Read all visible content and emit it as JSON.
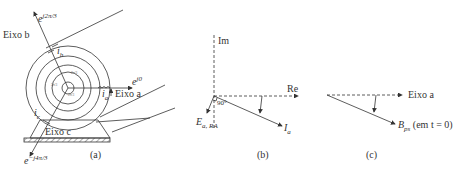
{
  "panels": [
    {
      "id": "a",
      "caption": "(a)",
      "labels": {
        "axis_a": "Eixo a",
        "axis_b": "Eixo b",
        "axis_c": "Eixo c",
        "phasor_a": "e^{j0}",
        "phasor_b": "e^{j2π/3}",
        "phasor_c": "e^{-j4π/3}",
        "current_a": "i_a",
        "current_b": "i_b",
        "current_c": "i_c",
        "inner_angle_label": "2π/3"
      }
    },
    {
      "id": "b",
      "caption": "(b)",
      "labels": {
        "imag_axis": "Im",
        "real_axis": "Re",
        "angle": "90°",
        "emf": "E_{a,RA}",
        "current": "I_a"
      }
    },
    {
      "id": "c",
      "caption": "(c)",
      "labels": {
        "axis_a": "Eixo a",
        "field": "B_ps (em t = 0)"
      }
    }
  ],
  "text": {
    "eixo_b": "Eixo b",
    "eixo_a": "Eixo a",
    "eixo_c": "Eixo c",
    "e_j0": "e",
    "e_j0_sup": "j0",
    "e_b": "e",
    "e_b_sup": "j2π/3",
    "e_c": "e",
    "e_c_sup": "−j4π/3",
    "i_a": "i",
    "i_a_sub": "a",
    "i_b": "i",
    "i_b_sub": "b",
    "i_c": "i",
    "i_c_sub": "c",
    "two_pi_3": "2π/3",
    "cap_a": "(a)",
    "im": "Im",
    "re": "Re",
    "deg90": "90°",
    "E": "E",
    "E_sub": "a, RA",
    "I": "I",
    "I_sub": "a",
    "cap_b": "(b)",
    "eixo_a_c": "Eixo a",
    "B": "B",
    "B_sub": "ps",
    "B_tail": " (em t = 0)",
    "cap_c": "(c)"
  }
}
